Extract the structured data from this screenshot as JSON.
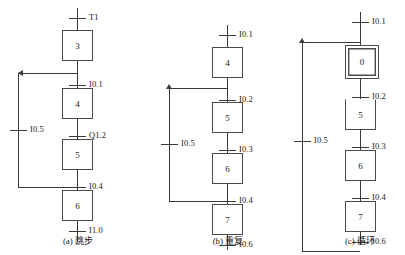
{
  "figure": {
    "kind": "sequential-function-chart",
    "line_color": "#3a3a3a",
    "box_color": "#4a4a4a",
    "background": "#ffffff"
  },
  "diagrams": [
    {
      "id": "a",
      "caption": "(a) 跳步",
      "branch_label": "I0.5",
      "top_label": "T1",
      "steps": [
        {
          "number": "3",
          "initial": false
        },
        {
          "number": "4",
          "initial": false
        },
        {
          "number": "5",
          "initial": false
        },
        {
          "number": "6",
          "initial": false
        }
      ],
      "transitions": [
        {
          "label": "T1"
        },
        {
          "label": "I0.1"
        },
        {
          "label": "Q1.2"
        },
        {
          "label": "I0.4"
        },
        {
          "label": "I1.0"
        }
      ]
    },
    {
      "id": "b",
      "caption": "(b) 重复",
      "branch_label": "I0.5",
      "top_label": "I0.1",
      "steps": [
        {
          "number": "4",
          "initial": false
        },
        {
          "number": "5",
          "initial": false
        },
        {
          "number": "6",
          "initial": false
        },
        {
          "number": "7",
          "initial": false
        }
      ],
      "transitions": [
        {
          "label": "I0.1"
        },
        {
          "label": "I0.2"
        },
        {
          "label": "I0.3"
        },
        {
          "label": "I0.4"
        },
        {
          "label": "I0.6"
        }
      ]
    },
    {
      "id": "c",
      "caption": "(c) 循环",
      "branch_label": "I0.5",
      "top_label": "I0.1",
      "steps": [
        {
          "number": "0",
          "initial": true
        },
        {
          "number": "5",
          "initial": false
        },
        {
          "number": "6",
          "initial": false
        },
        {
          "number": "7",
          "initial": false
        }
      ],
      "transitions": [
        {
          "label": "I0.1"
        },
        {
          "label": "I0.2"
        },
        {
          "label": "I0.3"
        },
        {
          "label": "I0.4"
        },
        {
          "label": "I0.6"
        }
      ]
    }
  ]
}
